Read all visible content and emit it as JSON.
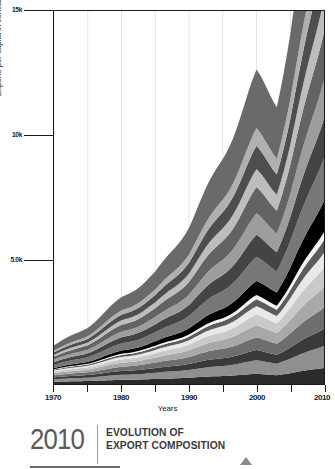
{
  "figure": {
    "y_axis_title": "Exports per capita in constant 2010 US Dollars",
    "x_axis_title": "Years"
  },
  "caption": {
    "year": "2010",
    "line1": "EVOLUTION OF",
    "line2": "EXPORT COMPOSITION",
    "marker_icon": "triangle-up-icon"
  },
  "chart_data": {
    "type": "area",
    "title": "Evolution of Export Composition",
    "xlabel": "Years",
    "ylabel": "Exports per capita in constant 2010 US Dollars",
    "xlim": [
      1970,
      2010
    ],
    "ylim": [
      0,
      15000
    ],
    "grid": "vertical",
    "legend": "none",
    "stacked": true,
    "y_ticks": [
      5000,
      10000,
      15000
    ],
    "y_tick_labels": [
      "5.0k",
      "10k",
      "15k"
    ],
    "x_ticks": [
      1970,
      1975,
      1980,
      1985,
      1990,
      1995,
      2000,
      2005,
      2010
    ],
    "x_tick_labels": [
      "1970",
      "",
      "1980",
      "",
      "1990",
      "",
      "2000",
      "",
      "2010"
    ],
    "x": [
      1970,
      1975,
      1980,
      1985,
      1990,
      1995,
      2000,
      2005,
      2010
    ],
    "series": [
      {
        "name": "layer-01",
        "color": "#2b2b2b",
        "values": [
          180,
          210,
          250,
          270,
          300,
          340,
          380,
          420,
          470
        ]
      },
      {
        "name": "layer-02",
        "color": "#8f8f8f",
        "values": [
          200,
          240,
          300,
          330,
          380,
          430,
          500,
          560,
          640
        ]
      },
      {
        "name": "layer-03",
        "color": "#3a3a3a",
        "values": [
          150,
          180,
          230,
          250,
          290,
          330,
          380,
          430,
          500
        ]
      },
      {
        "name": "layer-04",
        "color": "#6e6e6e",
        "values": [
          170,
          200,
          260,
          290,
          340,
          400,
          470,
          540,
          620
        ]
      },
      {
        "name": "layer-05",
        "color": "#a8a8a8",
        "values": [
          160,
          190,
          240,
          270,
          320,
          380,
          450,
          520,
          600
        ]
      },
      {
        "name": "layer-06",
        "color": "#c9c9c9",
        "values": [
          130,
          160,
          200,
          230,
          280,
          330,
          400,
          470,
          560
        ]
      },
      {
        "name": "layer-07",
        "color": "#e8e8e8",
        "values": [
          90,
          110,
          150,
          170,
          210,
          260,
          310,
          370,
          440
        ]
      },
      {
        "name": "layer-08",
        "color": "#5c5c5c",
        "values": [
          70,
          90,
          120,
          140,
          170,
          210,
          260,
          310,
          370
        ]
      },
      {
        "name": "layer-09",
        "color": "#f2f2f2",
        "values": [
          40,
          50,
          70,
          85,
          105,
          130,
          160,
          195,
          235
        ]
      },
      {
        "name": "layer-10",
        "color": "#000000",
        "values": [
          100,
          130,
          190,
          230,
          300,
          400,
          520,
          680,
          900
        ]
      },
      {
        "name": "layer-11",
        "color": "#777777",
        "values": [
          260,
          330,
          430,
          480,
          600,
          760,
          900,
          1020,
          1250
        ]
      },
      {
        "name": "layer-12",
        "color": "#444444",
        "values": [
          220,
          280,
          370,
          420,
          530,
          680,
          820,
          930,
          1150
        ]
      },
      {
        "name": "layer-13",
        "color": "#9d9d9d",
        "values": [
          200,
          260,
          340,
          390,
          500,
          650,
          790,
          900,
          1120
        ]
      },
      {
        "name": "layer-14",
        "color": "#636363",
        "values": [
          240,
          310,
          410,
          470,
          610,
          800,
          980,
          1120,
          1400
        ]
      },
      {
        "name": "layer-15",
        "color": "#bdbdbd",
        "values": [
          150,
          200,
          270,
          310,
          410,
          540,
          670,
          770,
          970
        ]
      },
      {
        "name": "layer-16",
        "color": "#4e4e4e",
        "values": [
          190,
          250,
          340,
          390,
          520,
          690,
          860,
          990,
          1260
        ]
      },
      {
        "name": "layer-17",
        "color": "#b0b0b0",
        "values": [
          140,
          190,
          260,
          300,
          400,
          530,
          660,
          760,
          970
        ]
      },
      {
        "name": "layer-18",
        "color": "#6a6a6a",
        "values": [
          430,
          580,
          810,
          950,
          1290,
          1740,
          2180,
          2520,
          3250
        ]
      }
    ],
    "totals": [
      3120,
      3960,
      5240,
      5975,
      7855,
      10400,
      12690,
      14605,
      18105
    ]
  }
}
